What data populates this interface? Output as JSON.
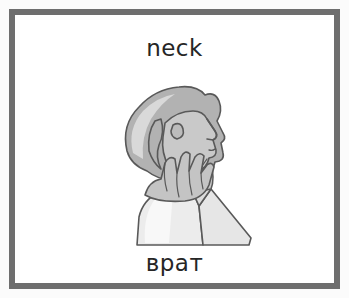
{
  "card": {
    "frame_color": "#6e6e6e",
    "background_color": "#ffffff",
    "page_background_color": "#fbfbfb"
  },
  "vocabulary": {
    "english_word": "neck",
    "translated_word": "врат"
  },
  "illustration": {
    "name": "person-touching-neck-illustration",
    "description": "Grayscale line drawing of a person shown in profile looking upward with one hand placed on the neck",
    "colors": {
      "outline": "#595959",
      "hair_base": "#b2b2b2",
      "hair_highlight": "#d9d9d9",
      "skin": "#c9c9c9",
      "skin_shadow": "#bcbcbc",
      "hand": "#c4c4c4",
      "shirt": "#ececec",
      "shirt_shadow": "#dcdcdc"
    }
  }
}
